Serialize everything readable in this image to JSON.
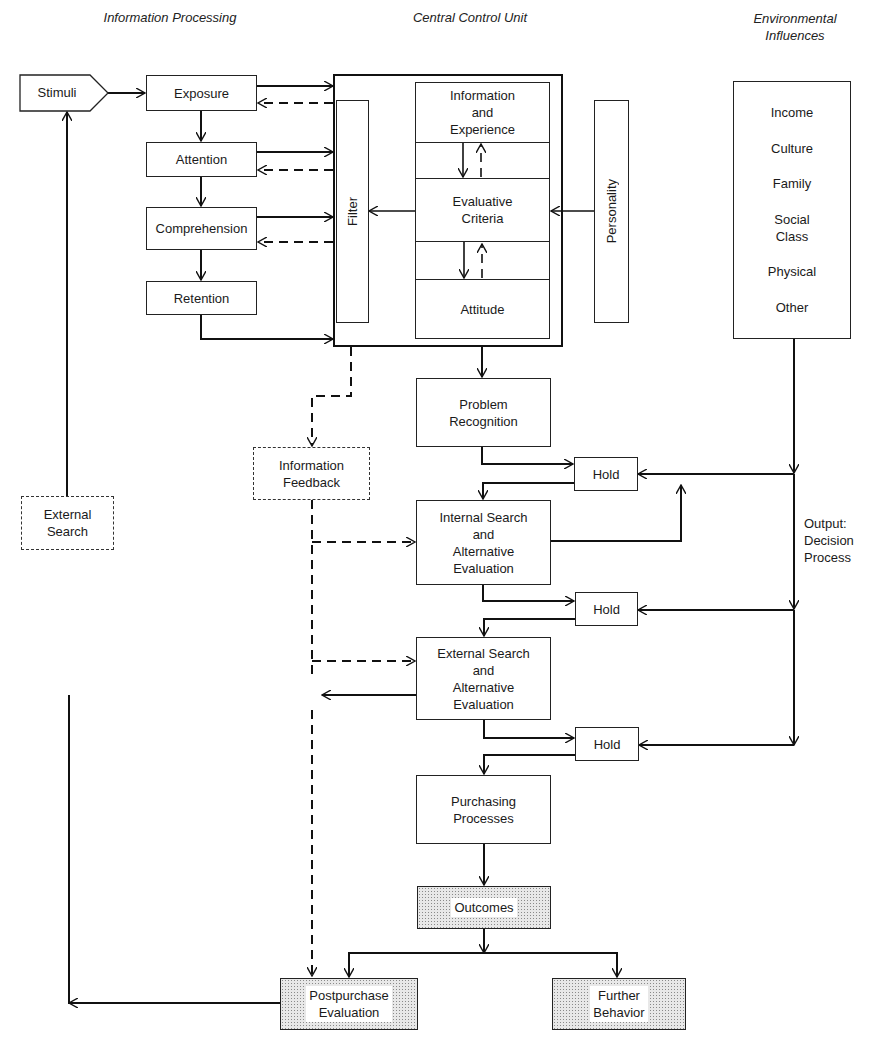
{
  "headers": {
    "information_processing": "Information Processing",
    "central_control_unit": "Central Control Unit",
    "environmental_influences_line1": "Environmental",
    "environmental_influences_line2": "Influences"
  },
  "information_processing": {
    "stimuli": "Stimuli",
    "exposure": "Exposure",
    "attention": "Attention",
    "comprehension": "Comprehension",
    "retention": "Retention"
  },
  "central_control_unit": {
    "filter": "Filter",
    "personality": "Personality",
    "information_experience": [
      "Information",
      "and",
      "Experience"
    ],
    "evaluative_criteria": [
      "Evaluative",
      "Criteria"
    ],
    "attitude": "Attitude"
  },
  "environmental_influences": {
    "items": [
      "Income",
      "Culture",
      "Family",
      "Social Class",
      "Physical",
      "Other"
    ],
    "social_class_lines": [
      "Social",
      "Class"
    ]
  },
  "decision_process": {
    "output_label": [
      "Output:",
      "Decision",
      "Process"
    ],
    "problem_recognition": [
      "Problem",
      "Recognition"
    ],
    "hold": "Hold",
    "internal_search": [
      "Internal Search",
      "and",
      "Alternative",
      "Evaluation"
    ],
    "external_search_eval": [
      "External Search",
      "and",
      "Alternative",
      "Evaluation"
    ],
    "purchasing_processes": [
      "Purchasing",
      "Processes"
    ],
    "outcomes": "Outcomes",
    "postpurchase_evaluation": [
      "Postpurchase",
      "Evaluation"
    ],
    "further_behavior": [
      "Further",
      "Behavior"
    ]
  },
  "feedback": {
    "information_feedback": [
      "Information",
      "Feedback"
    ],
    "external_search": [
      "External",
      "Search"
    ]
  },
  "colors": {
    "line": "#111111",
    "background": "#ffffff",
    "shading": "#8a8a8a"
  }
}
